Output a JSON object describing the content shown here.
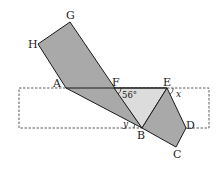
{
  "diagram": {
    "type": "geometry-figure",
    "colors": {
      "dark_fill": "#a9a9a9",
      "light_fill": "#dcdcdc",
      "stroke": "#1a1a1a",
      "dashed": "#333333",
      "background": "#ffffff"
    },
    "points": {
      "G": {
        "label": "G",
        "x": 70,
        "y": 22
      },
      "H": {
        "label": "H",
        "x": 38,
        "y": 44
      },
      "A": {
        "label": "A",
        "x": 66,
        "y": 88
      },
      "F": {
        "label": "F",
        "x": 114,
        "y": 88
      },
      "E": {
        "label": "E",
        "x": 167,
        "y": 88
      },
      "D": {
        "label": "D",
        "x": 186,
        "y": 128
      },
      "B": {
        "label": "B",
        "x": 142,
        "y": 128
      },
      "C": {
        "label": "C",
        "x": 176,
        "y": 147
      }
    },
    "dashed_rectangle": {
      "x1": 19,
      "y1": 88,
      "x2": 209,
      "y2": 128
    },
    "angles": {
      "angle_F": {
        "text": "56°"
      },
      "angle_x": {
        "text": "x"
      },
      "angle_y": {
        "text": "y"
      }
    }
  }
}
